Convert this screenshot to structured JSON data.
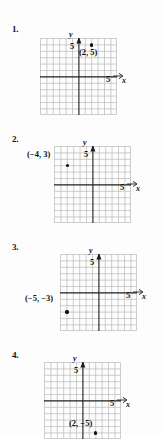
{
  "document": {
    "type": "math-worksheet",
    "title": "Plot the point on a coordinate plane",
    "background_color": "#fdfdfd",
    "ink_color": "#121212"
  },
  "grid": {
    "columns": 12,
    "rows": 12,
    "cell_px": 6.4,
    "minor_line_color": "#b4b4b4",
    "axis_line_color": "#1e1e1e",
    "x_axis_row_from_top": 6,
    "y_axis_col_from_left": 6,
    "tick_value": "5"
  },
  "problems": [
    {
      "number": "1.",
      "x_axis_label": "x",
      "y_axis_label": "y",
      "y_tick_label": "5",
      "x_tick_label": "5",
      "point_label": "(2, 5)",
      "point": {
        "x": 2,
        "y": 5
      },
      "label_position": "below-right"
    },
    {
      "number": "2.",
      "x_axis_label": "x",
      "y_axis_label": "y",
      "y_tick_label": "5",
      "x_tick_label": "5",
      "point_label": "(−4, 3)",
      "point": {
        "x": -4,
        "y": 3
      },
      "label_position": "above-left"
    },
    {
      "number": "3.",
      "x_axis_label": "x",
      "y_axis_label": "y",
      "y_tick_label": "5",
      "x_tick_label": "5",
      "point_label": "(−5, −3)",
      "point": {
        "x": -5,
        "y": -3
      },
      "label_position": "above-left"
    },
    {
      "number": "4.",
      "x_axis_label": "x",
      "y_axis_label": "y",
      "y_tick_label": "5",
      "x_tick_label": "5",
      "point_label": "(2, −5)",
      "point": {
        "x": 2,
        "y": -5
      },
      "label_position": "above-right"
    }
  ]
}
